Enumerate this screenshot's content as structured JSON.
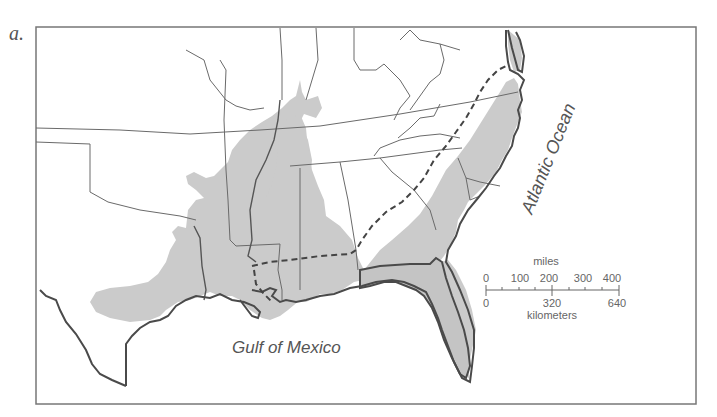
{
  "figure": {
    "panel_label": "a.",
    "labels": {
      "atlantic": "Atlantic Ocean",
      "gulf": "Gulf of Mexico"
    },
    "scale_bar": {
      "miles_title": "miles",
      "miles_ticks": [
        "0",
        "100",
        "200",
        "300",
        "400"
      ],
      "km_title": "kilometers",
      "km_ticks": [
        "0",
        "320",
        "640"
      ]
    },
    "colors": {
      "shaded_region": "#c9c9c9",
      "coastline": "#4a4a4a",
      "state_border": "#6a6a6a",
      "dashed_line": "#444444",
      "frame": "#777777"
    }
  }
}
